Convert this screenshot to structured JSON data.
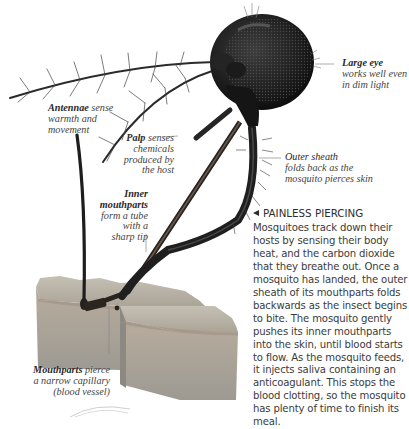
{
  "labels": {
    "large_eye": {
      "title": "Large eye",
      "desc_lines": [
        "works well even",
        "in dim light"
      ]
    },
    "antennae": {
      "title": "Antennae",
      "desc_lines": [
        " sense",
        "warmth and",
        "movement"
      ]
    },
    "palp": {
      "title": "Palp",
      "desc_lines": [
        " senses",
        "chemicals",
        "produced by",
        "the host"
      ]
    },
    "outer_sheath": {
      "title": "Outer sheath",
      "desc_lines": [
        "folds back as the",
        "mosquito pierces skin"
      ]
    },
    "inner_mouthparts": {
      "title_lines": [
        "Inner",
        "mouthparts"
      ],
      "desc_lines": [
        "form a tube",
        "with a",
        "sharp tip"
      ]
    },
    "mouthparts_pierce": {
      "title": "Mouthparts",
      "desc_lines": [
        " pierce",
        "a narrow capillary",
        "(blood vessel)"
      ]
    }
  },
  "article": {
    "heading_icon": "left-triangle-icon",
    "heading": "PAINLESS PIERCING",
    "body": "Mosquitoes track down their hosts by sensing their body heat, and the carbon dioxide that they breathe out. Once a mosquito has landed, the outer sheath of its mouthparts folds backwards as the insect begins to bite. The mosquito gently pushes its inner mouthparts into the skin, until blood starts to flow. As the mosquito feeds, it injects saliva containing an anticoagulant. This stops the blood clotting, so the mosquito has plenty of time to finish its meal."
  },
  "colors": {
    "background": "#ffffff",
    "text": "#3b3b3b",
    "insect": "#1e1e1e",
    "skin_top": "#b9b3a6",
    "skin_side": "#a8a49c"
  }
}
